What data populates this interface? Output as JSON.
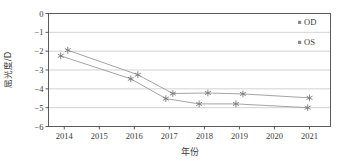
{
  "chart_data": {
    "type": "line",
    "title": "",
    "xlabel": "年份",
    "ylabel": "屈光度/D",
    "categories": [
      "2014",
      "2015",
      "2016",
      "2017",
      "2018",
      "2019",
      "2020",
      "2021"
    ],
    "x": [
      2014,
      2015,
      2016,
      2017,
      2018,
      2019,
      2020,
      2021
    ],
    "xlim": [
      2013.55,
      2021.6
    ],
    "ylim": [
      -6,
      0
    ],
    "yticks": [
      0,
      -1,
      -2,
      -3,
      -4,
      -5,
      -6
    ],
    "yticklabels": [
      "0",
      "−1",
      "−2",
      "−3",
      "−4",
      "−5",
      "−6"
    ],
    "xticklabels": [
      "2014",
      "2015",
      "2016",
      "2017",
      "2018",
      "2019",
      "2020",
      "2021"
    ],
    "grid": true,
    "grid_axis": "y",
    "legend_position": "top-right",
    "series": [
      {
        "name": "OD",
        "marker": "asterisk",
        "color": "#8a8a8a",
        "points": [
          {
            "x": 2014.1,
            "y": -1.95
          },
          {
            "x": 2016.1,
            "y": -3.25
          },
          {
            "x": 2017.1,
            "y": -4.25
          },
          {
            "x": 2018.1,
            "y": -4.22
          },
          {
            "x": 2019.1,
            "y": -4.27
          },
          {
            "x": 2021.0,
            "y": -4.48
          }
        ],
        "values": [
          -1.95,
          null,
          -3.25,
          -4.25,
          -4.22,
          -4.27,
          null,
          -4.48
        ]
      },
      {
        "name": "OS",
        "marker": "asterisk",
        "color": "#8a8a8a",
        "points": [
          {
            "x": 2013.9,
            "y": -2.25
          },
          {
            "x": 2015.9,
            "y": -3.47
          },
          {
            "x": 2016.9,
            "y": -4.52
          },
          {
            "x": 2017.85,
            "y": -4.8
          },
          {
            "x": 2018.9,
            "y": -4.8
          },
          {
            "x": 2020.95,
            "y": -5.0
          }
        ],
        "values": [
          -2.25,
          null,
          -3.47,
          -4.52,
          -4.8,
          -4.8,
          null,
          -5.0
        ]
      }
    ],
    "legend": [
      {
        "label": "OD",
        "marker": "square",
        "color": "#8a8a8a"
      },
      {
        "label": "OS",
        "marker": "square",
        "color": "#8a8a8a"
      }
    ]
  },
  "colors": {
    "axis": "#4a4a4a",
    "grid": "#c8c8c8",
    "series_line": "#9a9a9a",
    "marker": "#777777",
    "text": "#3a3a3a",
    "background": "#ffffff"
  }
}
